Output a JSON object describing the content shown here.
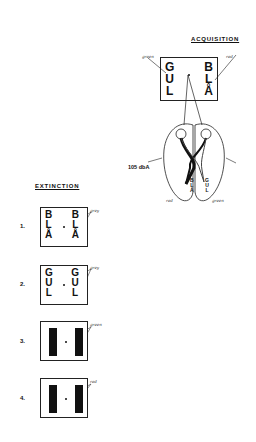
{
  "acquisition": {
    "title": "ACQUISITION",
    "left_word": [
      "G",
      "U",
      "L"
    ],
    "right_word": [
      "B",
      "L",
      "Å"
    ],
    "left_color_label": "green",
    "right_color_label": "red",
    "sound_label": "105 dbA",
    "brain_left_letters": [
      "B",
      "L",
      "Å"
    ],
    "brain_right_letters": [
      "G",
      "U",
      "L"
    ],
    "brain_left_hemisphere_label": "red",
    "brain_right_hemisphere_label": "green"
  },
  "extinction": {
    "title": "EXTINCTION",
    "trials": [
      {
        "number": "1.",
        "type": "letters",
        "left": [
          "B",
          "L",
          "Å"
        ],
        "right": [
          "B",
          "L",
          "Å"
        ],
        "color_label": "grey"
      },
      {
        "number": "2.",
        "type": "letters",
        "left": [
          "G",
          "U",
          "L"
        ],
        "right": [
          "G",
          "U",
          "L"
        ],
        "color_label": "grey"
      },
      {
        "number": "3.",
        "type": "bars",
        "color_label": "green"
      },
      {
        "number": "4.",
        "type": "bars",
        "color_label": "red"
      }
    ]
  }
}
